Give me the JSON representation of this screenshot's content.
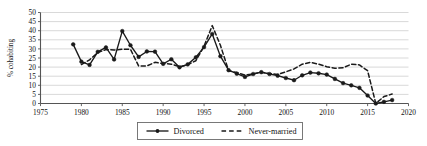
{
  "chart_data": {
    "type": "line",
    "title": "",
    "subtitle": "",
    "xlabel": "",
    "ylabel": "% cohabiting",
    "xlim": [
      1975,
      2020
    ],
    "ylim": [
      0,
      50
    ],
    "xticks": [
      1975,
      1980,
      1985,
      1990,
      1995,
      2000,
      2005,
      2010,
      2015,
      2020
    ],
    "yticks": [
      0,
      5,
      10,
      15,
      20,
      25,
      30,
      35,
      40,
      45,
      50
    ],
    "grid": "horizontal",
    "legend_position": "bottom-center",
    "series": [
      {
        "name": "Divorced",
        "style": "solid",
        "marker": "filled-circle",
        "color": "#1a1a1a",
        "x": [
          1979,
          1980,
          1981,
          1982,
          1983,
          1984,
          1985,
          1986,
          1987,
          1988,
          1989,
          1990,
          1991,
          1992,
          1993,
          1994,
          1995,
          1996,
          1997,
          1998,
          1999,
          2000,
          2001,
          2002,
          2003,
          2004,
          2005,
          2006,
          2007,
          2008,
          2009,
          2010,
          2011,
          2012,
          2013,
          2014,
          2015,
          2016,
          2017,
          2018
        ],
        "values": [
          32.5,
          23.0,
          21.2,
          28.4,
          30.8,
          24.2,
          39.8,
          32.0,
          25.6,
          28.6,
          28.5,
          21.8,
          24.3,
          19.9,
          21.5,
          25.4,
          31.0,
          38.2,
          26.0,
          18.3,
          16.4,
          14.6,
          16.2,
          17.2,
          16.2,
          15.3,
          14.0,
          12.8,
          15.5,
          17.0,
          16.6,
          15.9,
          13.5,
          11.2,
          10.0,
          8.6,
          4.4,
          0.0,
          0.9,
          1.9
        ]
      },
      {
        "name": "Never-married",
        "style": "dashed",
        "marker": "none",
        "color": "#1a1a1a",
        "x": [
          1980,
          1981,
          1982,
          1983,
          1984,
          1985,
          1986,
          1987,
          1988,
          1989,
          1990,
          1991,
          1992,
          1993,
          1994,
          1995,
          1996,
          1997,
          1998,
          1999,
          2000,
          2001,
          2002,
          2003,
          2004,
          2005,
          2006,
          2007,
          2008,
          2009,
          2010,
          2011,
          2012,
          2013,
          2014,
          2015,
          2016,
          2017,
          2018
        ],
        "values": [
          21.4,
          24.0,
          28.0,
          29.6,
          29.4,
          29.8,
          29.8,
          20.6,
          20.6,
          22.6,
          22.0,
          21.6,
          20.2,
          21.3,
          23.5,
          31.5,
          42.8,
          32.0,
          18.0,
          17.0,
          15.6,
          16.3,
          17.2,
          16.4,
          16.0,
          17.4,
          19.0,
          21.6,
          22.6,
          21.6,
          20.2,
          19.4,
          19.6,
          21.6,
          21.2,
          18.0,
          0.0,
          3.8,
          5.2
        ]
      }
    ],
    "legend": [
      {
        "label": "Divorced",
        "style": "solid-with-marker"
      },
      {
        "label": "Never-married",
        "style": "dashed"
      }
    ]
  },
  "labels": {
    "y_axis_title": "% cohabiting",
    "yticks": [
      "0",
      "5",
      "10",
      "15",
      "20",
      "25",
      "30",
      "35",
      "40",
      "45",
      "50"
    ],
    "xticks": [
      "1975",
      "1980",
      "1985",
      "1990",
      "1995",
      "2000",
      "2005",
      "2010",
      "2015",
      "2020"
    ],
    "legend_divorced": "Divorced",
    "legend_never_married": "Never-married"
  },
  "colors": {
    "line": "#1a1a1a",
    "grid": "#c9c9c9",
    "axis": "#555555",
    "legend_border": "#6b6b6b",
    "background": "#ffffff"
  }
}
